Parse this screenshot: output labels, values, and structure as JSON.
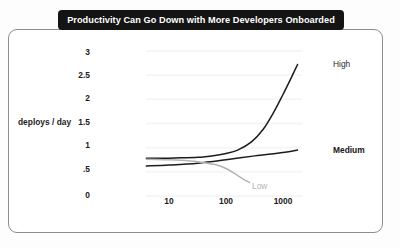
{
  "chart_data": {
    "type": "line",
    "title": "Productivity Can Go Down with More Developers Onboarded",
    "xlabel": "",
    "ylabel": "deploys / day",
    "xscale": "log",
    "xlim": [
      4,
      2200
    ],
    "ylim": [
      0,
      3
    ],
    "xticks": [
      "10",
      "100",
      "1000"
    ],
    "xtick_values": [
      10,
      100,
      1000
    ],
    "yticks": [
      "0",
      ".5",
      "1",
      "1.5",
      "2",
      "2.5",
      "3"
    ],
    "ytick_values": [
      0,
      0.5,
      1,
      1.5,
      2,
      2.5,
      3
    ],
    "grid": true,
    "legend": "inline-right",
    "series": [
      {
        "name": "High",
        "color": "#1c1c1c",
        "label_color": "#2a2a2a",
        "x": [
          4,
          8,
          16,
          32,
          64,
          100,
          160,
          280,
          450,
          700,
          1000,
          1400,
          1800
        ],
        "values": [
          0.78,
          0.78,
          0.79,
          0.8,
          0.84,
          0.88,
          0.95,
          1.12,
          1.38,
          1.75,
          2.1,
          2.45,
          2.72
        ]
      },
      {
        "name": "Medium",
        "color": "#1c1c1c",
        "label_color": "#151515",
        "x": [
          4,
          10,
          32,
          100,
          320,
          1000,
          1800
        ],
        "values": [
          0.62,
          0.64,
          0.68,
          0.75,
          0.83,
          0.9,
          0.95
        ]
      },
      {
        "name": "Low",
        "color": "#b4b4b4",
        "label_color": "#b4b4b4",
        "x": [
          4,
          8,
          16,
          32,
          64,
          100,
          140,
          200,
          260
        ],
        "values": [
          0.76,
          0.75,
          0.74,
          0.71,
          0.65,
          0.57,
          0.47,
          0.35,
          0.28
        ]
      }
    ]
  },
  "figure": {
    "background_color": "#fdfdfd",
    "frame_color": "#8d8d8f",
    "banner_color": "#141414",
    "banner_text_color": "#ffffff",
    "gridline_color": "#f6f6f6"
  }
}
